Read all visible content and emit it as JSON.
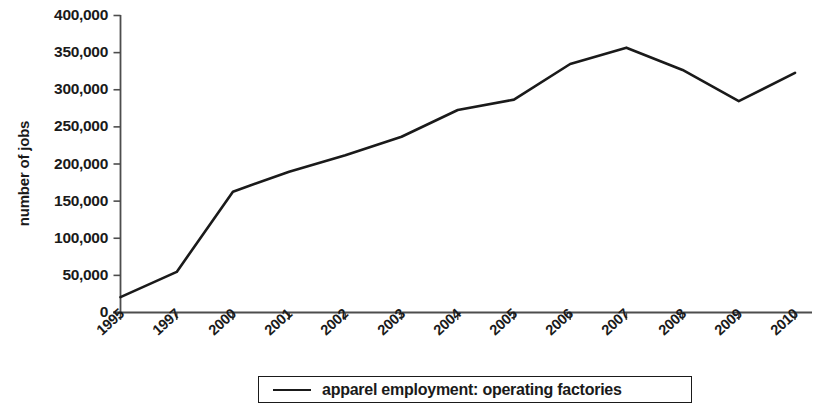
{
  "chart_data": {
    "type": "line",
    "title": "",
    "subtitle": "",
    "xlabel": "",
    "ylabel": "number of jobs",
    "categories": [
      "1995",
      "1997",
      "2000",
      "2001",
      "2002",
      "2003",
      "2004",
      "2005",
      "2006",
      "2007",
      "2008",
      "2009",
      "2010"
    ],
    "series": [
      {
        "name": "apparel employment: operating factories",
        "color": "#1a1a1a",
        "values": [
          20000,
          54000,
          162000,
          189000,
          211000,
          236000,
          272000,
          286000,
          334000,
          356000,
          326000,
          284000,
          322000
        ]
      }
    ],
    "ylim": [
      0,
      400000
    ],
    "yticks": [
      0,
      50000,
      100000,
      150000,
      200000,
      250000,
      300000,
      350000,
      400000
    ],
    "ytick_labels": [
      "0",
      "50,000",
      "100,000",
      "150,000",
      "200,000",
      "250,000",
      "300,000",
      "350,000",
      "400,000"
    ],
    "xtick_labels": [
      "1995",
      "1997",
      "2000",
      "2001",
      "2002",
      "2003",
      "2004",
      "2005",
      "2006",
      "2007",
      "2008",
      "2009",
      "2010"
    ],
    "grid": false,
    "legend_position": "bottom",
    "legend_entries": [
      "apparel employment: operating factories"
    ]
  },
  "legend": {
    "label": "apparel employment: operating factories"
  },
  "axes": {
    "y_axis_title": "number of jobs"
  },
  "colors": {
    "line": "#1a1a1a",
    "axis": "#4d4d4d",
    "text": "#1a1a1a",
    "background": "#ffffff"
  }
}
